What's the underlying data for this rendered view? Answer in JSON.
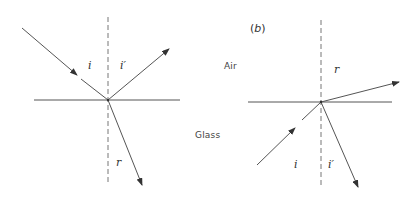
{
  "figure": {
    "panels": [
      {
        "id": "a",
        "caption": "",
        "labels": {
          "incident_angle": "i",
          "reflected_angle": "i′",
          "refracted_angle": "r"
        },
        "description": "Light ray travelling from air into glass: incident ray from upper left, reflected ray to upper right, refracted ray bending toward the normal in glass"
      },
      {
        "id": "b",
        "caption_open": "(",
        "caption_letter": "b",
        "caption_close": ")",
        "labels": {
          "incident_angle": "i",
          "reflected_angle": "i′",
          "refracted_angle": "r"
        },
        "description": "Light ray travelling from glass into air: incident ray from lower left, reflected ray back into glass, refracted ray bending away from the normal into air"
      }
    ],
    "media": {
      "upper": "Air",
      "lower": "Glass"
    },
    "colors": {
      "line": "#555555",
      "dashed_normal": "#777777",
      "surface": "#555555",
      "text": "#333333"
    }
  }
}
